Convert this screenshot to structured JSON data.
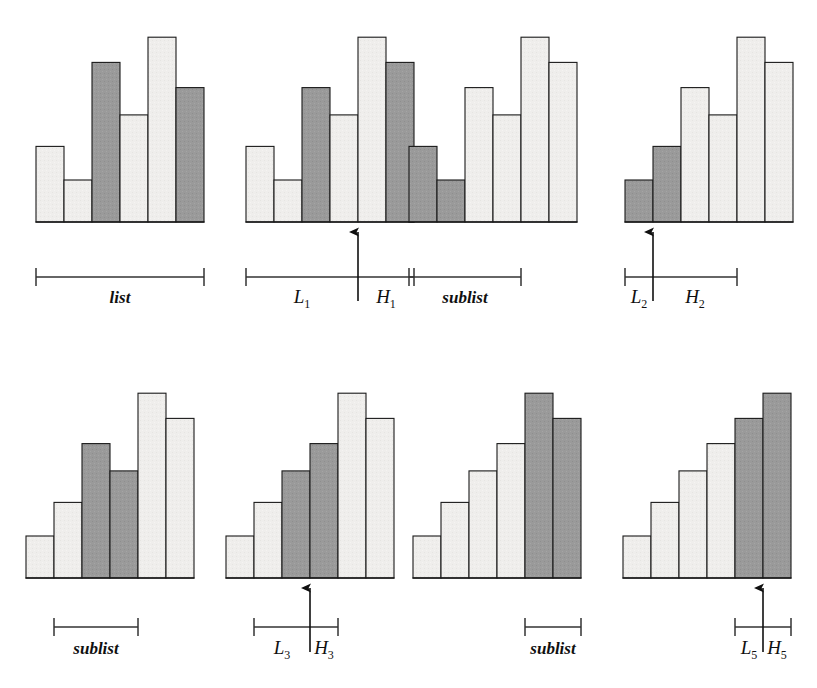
{
  "figure": {
    "title": "",
    "width": 817,
    "height": 688,
    "background": "#ffffff",
    "colors": {
      "light_fill": "#efeeec",
      "dark_fill": "#999999",
      "stroke": "#1a1a1a",
      "text": "#101010",
      "bracket": "#333333"
    }
  },
  "chart_data": {
    "type": "bar",
    "xlabel": "",
    "ylabel": "",
    "grid": false,
    "legend": "none",
    "ylim": [
      0,
      9
    ],
    "shading_legend": {
      "light": "unshaded element",
      "dark": "shaded / highlighted element"
    },
    "panels": [
      {
        "id": "panel-1",
        "row": 1,
        "col": 1,
        "bracket_label": "list",
        "bracket_from_bar": 1,
        "bracket_to_bar": 6,
        "arrow": null,
        "categories": [
          "1",
          "2",
          "3",
          "4",
          "5",
          "6"
        ],
        "values": [
          3.6,
          2.0,
          7.6,
          5.1,
          8.8,
          6.4
        ],
        "shades": [
          "light",
          "light",
          "dark",
          "light",
          "light",
          "dark"
        ]
      },
      {
        "id": "panel-2",
        "row": 1,
        "col": 2,
        "bracket_label": null,
        "bracket_left_label": "L_1",
        "bracket_right_label": "H_1",
        "bracket_from_bar": 1,
        "bracket_to_bar": 6,
        "arrow": {
          "at_boundary_after_bar": 4
        },
        "categories": [
          "1",
          "2",
          "3",
          "4",
          "5",
          "6"
        ],
        "values": [
          3.6,
          2.0,
          6.4,
          5.1,
          8.8,
          7.6
        ],
        "shades": [
          "light",
          "light",
          "dark",
          "light",
          "light",
          "dark"
        ]
      },
      {
        "id": "panel-3",
        "row": 1,
        "col": 3,
        "bracket_label": "sublist",
        "bracket_from_bar": 1,
        "bracket_to_bar": 4,
        "arrow": null,
        "categories": [
          "1",
          "2",
          "3",
          "4",
          "5",
          "6"
        ],
        "values": [
          3.6,
          2.0,
          6.4,
          5.1,
          8.8,
          7.6
        ],
        "shades": [
          "dark",
          "dark",
          "light",
          "light",
          "light",
          "light"
        ]
      },
      {
        "id": "panel-4",
        "row": 1,
        "col": 4,
        "bracket_label": null,
        "bracket_left_label": "L_2",
        "bracket_right_label": "H_2",
        "bracket_from_bar": 1,
        "bracket_to_bar": 4,
        "arrow": {
          "at_boundary_after_bar": 1
        },
        "categories": [
          "1",
          "2",
          "3",
          "4",
          "5",
          "6"
        ],
        "values": [
          2.0,
          3.6,
          6.4,
          5.1,
          8.8,
          7.6
        ],
        "shades": [
          "dark",
          "dark",
          "light",
          "light",
          "light",
          "light"
        ]
      },
      {
        "id": "panel-5",
        "row": 2,
        "col": 1,
        "bracket_label": "sublist",
        "bracket_from_bar": 2,
        "bracket_to_bar": 4,
        "arrow": null,
        "categories": [
          "1",
          "2",
          "3",
          "4",
          "5",
          "6"
        ],
        "values": [
          2.0,
          3.6,
          6.4,
          5.1,
          8.8,
          7.6
        ],
        "shades": [
          "light",
          "light",
          "dark",
          "dark",
          "light",
          "light"
        ]
      },
      {
        "id": "panel-6",
        "row": 2,
        "col": 2,
        "bracket_label": null,
        "bracket_left_label": "L_3",
        "bracket_right_label": "H_3",
        "bracket_from_bar": 2,
        "bracket_to_bar": 4,
        "arrow": {
          "at_boundary_after_bar": 3
        },
        "categories": [
          "1",
          "2",
          "3",
          "4",
          "5",
          "6"
        ],
        "values": [
          2.0,
          3.6,
          5.1,
          6.4,
          8.8,
          7.6
        ],
        "shades": [
          "light",
          "light",
          "dark",
          "dark",
          "light",
          "light"
        ]
      },
      {
        "id": "panel-7",
        "row": 2,
        "col": 3,
        "bracket_label": "sublist",
        "bracket_from_bar": 5,
        "bracket_to_bar": 6,
        "arrow": null,
        "categories": [
          "1",
          "2",
          "3",
          "4",
          "5",
          "6"
        ],
        "values": [
          2.0,
          3.6,
          5.1,
          6.4,
          8.8,
          7.6
        ],
        "shades": [
          "light",
          "light",
          "light",
          "light",
          "dark",
          "dark"
        ]
      },
      {
        "id": "panel-8",
        "row": 2,
        "col": 4,
        "bracket_label": null,
        "bracket_left_label": "L_5",
        "bracket_right_label": "H_5",
        "bracket_from_bar": 5,
        "bracket_to_bar": 6,
        "arrow": {
          "at_boundary_after_bar": 5
        },
        "categories": [
          "1",
          "2",
          "3",
          "4",
          "5",
          "6"
        ],
        "values": [
          2.0,
          3.6,
          5.1,
          6.4,
          7.6,
          8.8
        ],
        "shades": [
          "light",
          "light",
          "light",
          "light",
          "dark",
          "dark"
        ]
      }
    ]
  },
  "labels": {
    "list": "list",
    "sublist": "sublist",
    "L1": "L",
    "L1sub": "1",
    "H1": "H",
    "H1sub": "1",
    "L2": "L",
    "L2sub": "2",
    "H2": "H",
    "H2sub": "2",
    "L3": "L",
    "L3sub": "3",
    "H3": "H",
    "H3sub": "3",
    "L5": "L",
    "L5sub": "5",
    "H5": "H",
    "H5sub": "5"
  }
}
